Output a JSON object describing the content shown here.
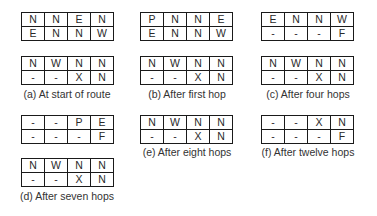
{
  "panels": [
    {
      "id": "a",
      "caption": "(a) At start of route",
      "grids": [
        [
          [
            "N",
            "N",
            "E",
            "N"
          ],
          [
            "E",
            "N",
            "N",
            "W"
          ]
        ],
        [
          [
            "N",
            "W",
            "N",
            "N"
          ],
          [
            "-",
            "-",
            "X",
            "N"
          ]
        ]
      ]
    },
    {
      "id": "b",
      "caption": "(b) After first hop",
      "grids": [
        [
          [
            "P",
            "N",
            "N",
            "E"
          ],
          [
            "E",
            "N",
            "N",
            "W"
          ]
        ],
        [
          [
            "N",
            "W",
            "N",
            "N"
          ],
          [
            "-",
            "-",
            "X",
            "N"
          ]
        ]
      ]
    },
    {
      "id": "c",
      "caption": "(c) After four hops",
      "grids": [
        [
          [
            "E",
            "N",
            "N",
            "W"
          ],
          [
            "-",
            "-",
            "-",
            "F"
          ]
        ],
        [
          [
            "N",
            "W",
            "N",
            "N"
          ],
          [
            "-",
            "-",
            "X",
            "N"
          ]
        ]
      ]
    },
    {
      "id": "d",
      "caption": "(d) After seven hops",
      "grids": [
        [
          [
            "-",
            "-",
            "P",
            "E"
          ],
          [
            "-",
            "-",
            "-",
            "F"
          ]
        ],
        [
          [
            "N",
            "W",
            "N",
            "N"
          ],
          [
            "-",
            "-",
            "X",
            "N"
          ]
        ]
      ]
    },
    {
      "id": "e",
      "caption": "(e) After eight hops",
      "grids": [
        [
          [
            "N",
            "W",
            "N",
            "N"
          ],
          [
            "-",
            "-",
            "X",
            "N"
          ]
        ]
      ]
    },
    {
      "id": "f",
      "caption": "(f) After twelve hops",
      "grids": [
        [
          [
            "-",
            "-",
            "X",
            "N"
          ],
          [
            "-",
            "-",
            "-",
            "F"
          ]
        ]
      ]
    }
  ]
}
